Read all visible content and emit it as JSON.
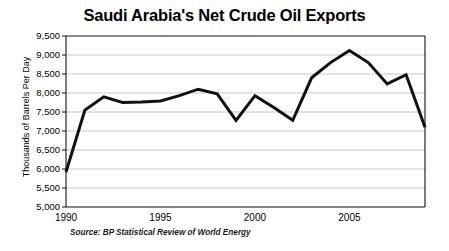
{
  "chart_data": {
    "type": "line",
    "title": "Saudi Arabia's Net Crude Oil Exports",
    "xlabel": "",
    "ylabel": "Thousands of Barrels Per Day",
    "source": "Source: BP Statistical Review of World Energy",
    "grid": true,
    "legend": "none",
    "xlim": [
      1990,
      2009
    ],
    "ylim": [
      5000,
      9500
    ],
    "ytick_labels": [
      "9,500",
      "9,000",
      "8,500",
      "8,000",
      "7,500",
      "7,000",
      "6,500",
      "6,000",
      "5,500",
      "5,000"
    ],
    "ytick_values": [
      9500,
      9000,
      8500,
      8000,
      7500,
      7000,
      6500,
      6000,
      5500,
      5000
    ],
    "xtick_labels": [
      "1990",
      "1995",
      "2000",
      "2005"
    ],
    "xtick_values": [
      1990,
      1995,
      2000,
      2005
    ],
    "line_color": "#111111",
    "line_width": 3,
    "x": [
      1990,
      1991,
      1992,
      1993,
      1994,
      1995,
      1996,
      1997,
      1998,
      1999,
      2000,
      2001,
      2002,
      2003,
      2004,
      2005,
      2006,
      2007,
      2008,
      2009
    ],
    "series": [
      {
        "name": "Net Crude Oil Exports",
        "values": [
          5920,
          7550,
          7900,
          7750,
          7760,
          7790,
          7930,
          8100,
          7980,
          7280,
          7930,
          7620,
          7280,
          8400,
          8800,
          9120,
          8800,
          8240,
          8480,
          7100
        ]
      }
    ]
  },
  "axes": {
    "plot_left": 66,
    "plot_right": 425,
    "plot_top": 36,
    "plot_bottom": 207
  }
}
